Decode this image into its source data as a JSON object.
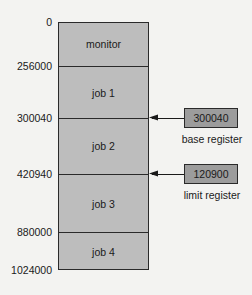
{
  "diagram": {
    "type": "memory-layout",
    "addresses": [
      {
        "label": "0",
        "y": 22
      },
      {
        "label": "256000",
        "y": 66
      },
      {
        "label": "300040",
        "y": 118
      },
      {
        "label": "420940",
        "y": 174
      },
      {
        "label": "880000",
        "y": 232
      },
      {
        "label": "1024000",
        "y": 270
      }
    ],
    "segments": [
      {
        "label": "monitor",
        "start": "0",
        "end": "256000"
      },
      {
        "label": "job 1",
        "start": "256000",
        "end": "300040"
      },
      {
        "label": "job 2",
        "start": "300040",
        "end": "420940"
      },
      {
        "label": "job 3",
        "start": "420940",
        "end": "880000"
      },
      {
        "label": "job 4",
        "start": "880000",
        "end": "1024000"
      }
    ],
    "registers": {
      "base": {
        "value": "300040",
        "label": "base register",
        "points_to": "300040"
      },
      "limit": {
        "value": "120900",
        "label": "limit register",
        "points_to": "420940"
      }
    },
    "colors": {
      "background": "#f3f3f1",
      "memory_fill": "#bdbdbd",
      "register_fill": "#9c9c9c",
      "stroke": "#2a2a2a"
    }
  }
}
